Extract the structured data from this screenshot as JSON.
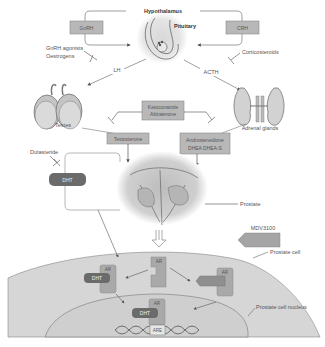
{
  "diagram": {
    "labels": {
      "hypothalamus": "Hypothalamus",
      "pituitary": "Pituitary",
      "gnrh": "GnRH",
      "crh": "CRH",
      "gnrh_agonists_line1": "GnRH agonists",
      "gnrh_agonists_line2": "Oestrogens",
      "corticosteroids": "Corticosteroids",
      "lh": "LH",
      "acth": "ACTH",
      "testes": "Testes",
      "adrenal_glands": "Adrenal glands",
      "inhibitor_line1": "Ketoconazole",
      "inhibitor_line2": "Abiraterone",
      "testosterone": "Testosterone",
      "adrenal_androgens_line1": "Androstenedione",
      "adrenal_androgens_line2": "DHEA DHEA-S",
      "dutasteride": "Dutasteride",
      "dht_outside": "DHT",
      "prostate": "Prostate",
      "mdv3100": "MDV3100",
      "prostate_cell": "Prostate cell",
      "prostate_cell_nucleus": "Prostate cell nucleus",
      "ar_bound": "AR",
      "dht_bound": "DHT",
      "ar_free": "AR",
      "ar_blocked": "AR",
      "ar_nuclear": "AR",
      "dht_nuclear": "DHT",
      "are": "ARE"
    },
    "colors": {
      "box_fill": "#b8b8b8",
      "box_stroke": "#8a8a8a",
      "pill_fill": "#6b6b6b",
      "cell_fill": "#d6d6d6",
      "nucleus_fill": "#cfcfcf",
      "ar_fill": "#a9a9a9",
      "line": "#777777"
    }
  }
}
